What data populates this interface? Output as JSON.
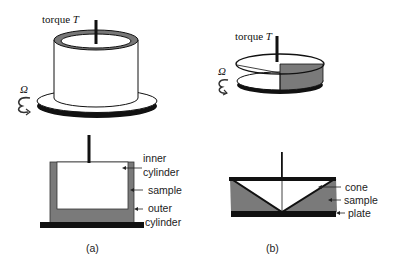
{
  "figure": {
    "panel_a": {
      "caption": "(a)",
      "title": "concentric cylinder geometry",
      "top": {
        "torque_label": "torque ",
        "torque_symbol": "T",
        "rotation_symbol": "Ω"
      },
      "cross_section": {
        "labels": {
          "inner_line1": "inner",
          "inner_line2": "cylinder",
          "sample": "sample",
          "outer_line1": "outer",
          "outer_line2": "cylinder"
        }
      }
    },
    "panel_b": {
      "caption": "(b)",
      "title": "cone and plate geometry",
      "top": {
        "torque_label": "torque ",
        "torque_symbol": "T",
        "rotation_symbol": "Ω"
      },
      "cross_section": {
        "labels": {
          "cone": "cone",
          "sample": "sample",
          "plate": "plate"
        }
      }
    },
    "colors": {
      "sample_gray": "#7a7a7a",
      "solid_black": "#111111",
      "background": "#ffffff"
    }
  }
}
